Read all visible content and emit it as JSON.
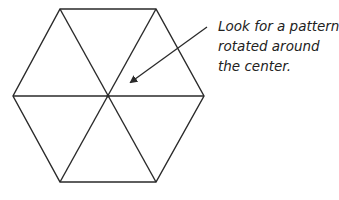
{
  "annotation": {
    "lines": [
      "Look for a pattern",
      "rotated around",
      "the center."
    ]
  },
  "diagram": {
    "shape": "regular hexagon divided into 6 equilateral triangles",
    "stroke_color": "#2a2a2a",
    "center": [
      108,
      96
    ],
    "vertices": [
      [
        60,
        9
      ],
      [
        156,
        9
      ],
      [
        204,
        96
      ],
      [
        156,
        182
      ],
      [
        60,
        182
      ],
      [
        13,
        96
      ]
    ],
    "arrow": {
      "from": [
        207,
        27
      ],
      "to": [
        130,
        83
      ]
    }
  }
}
